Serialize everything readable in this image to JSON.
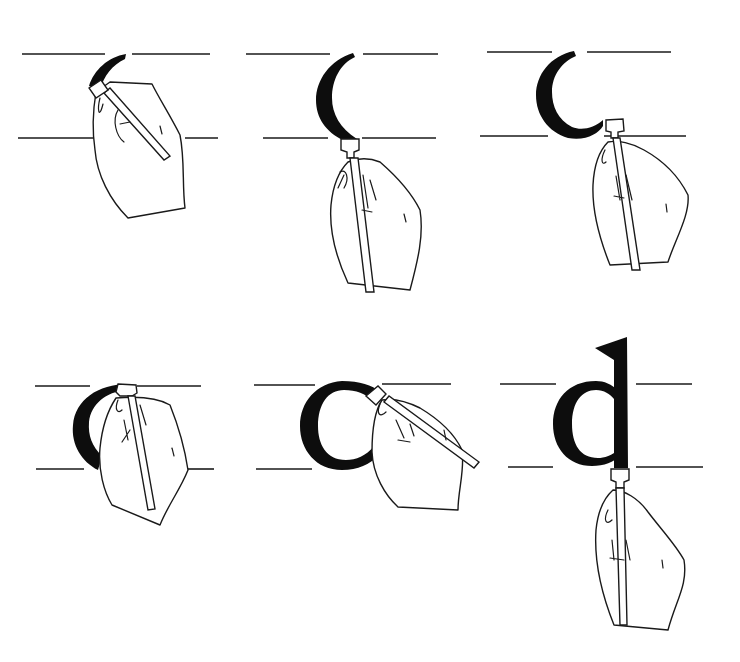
{
  "illustration": {
    "subject": "Calligraphy stroke sequence for lowercase letter d",
    "background": "#ffffff",
    "ink_color": "#0d0d0d",
    "line_color": "#1a1a1a",
    "panels": [
      {
        "step": 1,
        "stroke": "start of left curve at top",
        "guides": {
          "top": 54,
          "bottom": 138,
          "x1": 22,
          "x2": 215
        }
      },
      {
        "step": 2,
        "stroke": "left curve down to baseline",
        "guides": {
          "top": 54,
          "bottom": 138,
          "x1": 246,
          "x2": 438
        }
      },
      {
        "step": 3,
        "stroke": "curve ends with flick to right",
        "guides": {
          "top": 52,
          "bottom": 136,
          "x1": 483,
          "x2": 686
        }
      },
      {
        "step": 4,
        "stroke": "top of bowl begins",
        "guides": {
          "top": 386,
          "bottom": 469,
          "x1": 35,
          "x2": 214
        }
      },
      {
        "step": 5,
        "stroke": "bowl completed as c",
        "guides": {
          "top": 385,
          "bottom": 469,
          "x1": 255,
          "x2": 456
        }
      },
      {
        "step": 6,
        "stroke": "ascender stem drawn down",
        "guides": {
          "top": 384,
          "bottom": 467,
          "x1": 500,
          "x2": 703
        }
      }
    ]
  }
}
